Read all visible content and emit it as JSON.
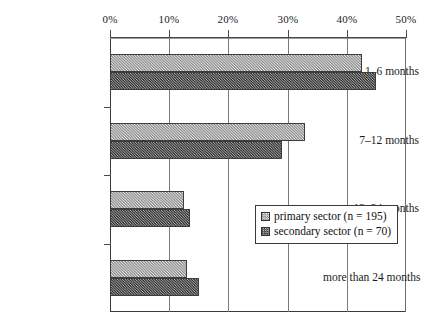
{
  "chart_data": {
    "type": "bar",
    "orientation": "horizontal",
    "title": "",
    "xlabel": "",
    "ylabel": "",
    "xlim": [
      0,
      50
    ],
    "xunit": "%",
    "grid": true,
    "legend_position": "inside-right",
    "categories": [
      "1–6 months",
      "7–12 months",
      "13–24  months",
      "more than 24 months"
    ],
    "xticks": [
      0,
      10,
      20,
      30,
      40,
      50
    ],
    "xtick_labels": [
      "0%",
      "10%",
      "20%",
      "30%",
      "40%",
      "50%"
    ],
    "series": [
      {
        "name": "primary sector (n = 195)",
        "short_name": "primary sector",
        "n": 195,
        "color": "#c8c8c8",
        "values": [
          42.5,
          33.0,
          12.5,
          13.0
        ]
      },
      {
        "name": "secondary sector (n = 70)",
        "short_name": "secondary sector",
        "n": 70,
        "color": "#6f6f6f",
        "values": [
          45.0,
          29.0,
          13.5,
          15.0
        ]
      }
    ]
  },
  "legend": {
    "items": [
      {
        "label": "primary sector (n = 195)"
      },
      {
        "label": "secondary sector (n = 70)"
      }
    ]
  }
}
